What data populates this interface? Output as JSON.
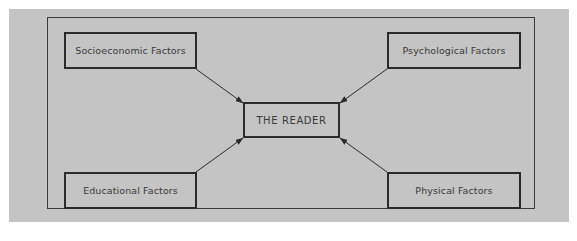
{
  "diagram": {
    "title": "",
    "center": {
      "label": "THE READER"
    },
    "factors": [
      {
        "id": "socioeconomic",
        "label": "Socioeconomic Factors",
        "position": "top-left"
      },
      {
        "id": "psychological",
        "label": "Psychological Factors",
        "position": "top-right"
      },
      {
        "id": "educational",
        "label": "Educational Factors",
        "position": "bottom-left"
      },
      {
        "id": "physical",
        "label": "Physical Factors",
        "position": "bottom-right"
      }
    ],
    "edges": [
      {
        "from": "socioeconomic",
        "to": "center"
      },
      {
        "from": "psychological",
        "to": "center"
      },
      {
        "from": "educational",
        "to": "center"
      },
      {
        "from": "physical",
        "to": "center"
      }
    ],
    "colors": {
      "background": "#c4c4c4",
      "border": "#2b2b2b",
      "text": "#3a3a3a"
    }
  }
}
